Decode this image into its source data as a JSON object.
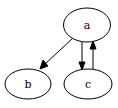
{
  "diagram": {
    "type": "directed-graph",
    "nodes": [
      {
        "id": "a",
        "label": "a",
        "cx": 87,
        "cy": 25,
        "rx": 23.5,
        "ry": 17
      },
      {
        "id": "b",
        "label": "b",
        "cx": 28,
        "cy": 84,
        "rx": 23,
        "ry": 15
      },
      {
        "id": "c",
        "label": "c",
        "cx": 88,
        "cy": 84,
        "rx": 24,
        "ry": 15
      }
    ],
    "edges": [
      {
        "from": "a",
        "to": "b"
      },
      {
        "from": "a",
        "to": "c"
      },
      {
        "from": "c",
        "to": "a"
      }
    ]
  },
  "colors": {
    "stroke": "#000000",
    "fill": "#ffffff",
    "background": "#ffffff"
  }
}
